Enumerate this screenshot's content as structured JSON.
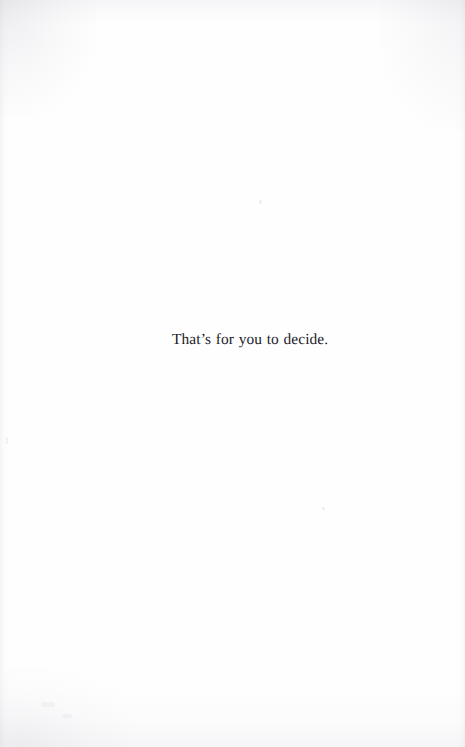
{
  "page": {
    "kind": "scanned-book-page",
    "width": 465,
    "height": 747,
    "background_color": "#fefeff",
    "ink_color": "#19191f",
    "paper_shading_color": "#9a9ca2"
  },
  "content": {
    "body_line": "That’s for you to decide."
  }
}
